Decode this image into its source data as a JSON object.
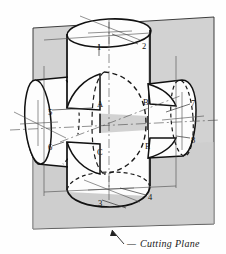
{
  "figure": {
    "caption": {
      "text": "Cutting Plane",
      "dash": "—"
    },
    "colors": {
      "plane_fill": "#d2d2d2",
      "plane_fill_shadow": "#c6c6c6",
      "outline": "#111111",
      "hidden_line": "#1a1a1a",
      "center_line": "#555555",
      "solid_face": "#fdfdfd",
      "background": "#fefefe"
    },
    "labels": [
      {
        "id": "n1",
        "text": "1",
        "x": 97,
        "y": 47
      },
      {
        "id": "n2",
        "text": "2",
        "x": 142,
        "y": 46
      },
      {
        "id": "n3",
        "text": "3",
        "x": 98,
        "y": 203
      },
      {
        "id": "n4",
        "text": "4",
        "x": 148,
        "y": 197
      },
      {
        "id": "n5",
        "text": "5",
        "x": 48,
        "y": 112
      },
      {
        "id": "n6",
        "text": "6",
        "x": 48,
        "y": 147
      },
      {
        "id": "n7",
        "text": "7",
        "x": 193,
        "y": 103
      },
      {
        "id": "n8",
        "text": "8",
        "x": 193,
        "y": 140
      },
      {
        "id": "pA",
        "text": "A",
        "x": 98,
        "y": 104
      },
      {
        "id": "pB",
        "text": "B",
        "x": 144,
        "y": 102
      },
      {
        "id": "pC",
        "text": "C",
        "x": 98,
        "y": 152
      },
      {
        "id": "pE",
        "text": "E",
        "x": 146,
        "y": 146
      }
    ]
  }
}
